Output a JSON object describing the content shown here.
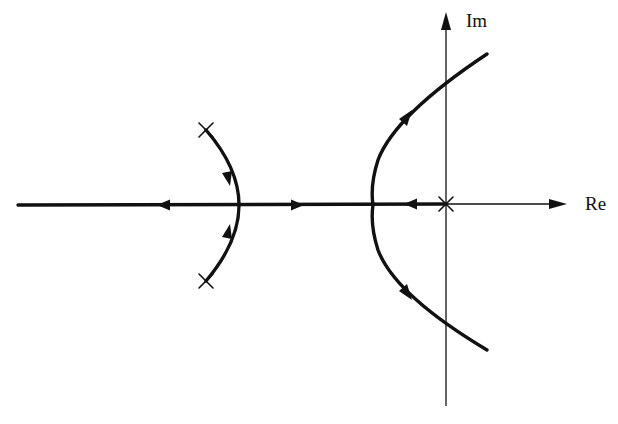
{
  "diagram": {
    "type": "root-locus",
    "axes": {
      "real_label": "Re",
      "imag_label": "Im",
      "origin_px": [
        446,
        204
      ]
    },
    "poles": [
      {
        "name": "pole-origin",
        "px": [
          446,
          204
        ]
      },
      {
        "name": "pole-upper-left",
        "px": [
          206,
          130
        ]
      },
      {
        "name": "pole-lower-left",
        "px": [
          206,
          281
        ]
      }
    ],
    "branches": [
      {
        "name": "real-axis-segment-left",
        "description": "real-axis locus extending to -infinity, arrow pointing left"
      },
      {
        "name": "real-axis-segment-middle",
        "description": "real-axis locus between break points, arrow pointing right"
      },
      {
        "name": "real-axis-segment-right",
        "description": "real-axis locus from origin pole, arrow pointing left"
      },
      {
        "name": "left-arc",
        "description": "complex poles meet on real axis at break-in point, arrows toward axis"
      },
      {
        "name": "right-parabola",
        "description": "branches break away from real axis into right half-plane, arrows outward"
      }
    ],
    "colors": {
      "stroke": "#111111",
      "background": "#ffffff"
    }
  }
}
